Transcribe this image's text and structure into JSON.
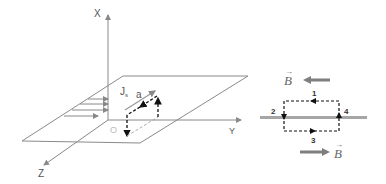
{
  "left_figure": {
    "axes": {
      "x_label": "X",
      "y_label": "Y",
      "z_label": "Z",
      "origin_label": "O"
    },
    "current_label": "J",
    "current_subscript": "s",
    "side_label": "a"
  },
  "right_figure": {
    "field_label_top": "B",
    "field_label_bottom": "B",
    "loop_segments": [
      "1",
      "2",
      "3",
      "4"
    ]
  },
  "colors": {
    "line": "#8a8a8a",
    "dark_line": "#222222",
    "field_arrow": "#7f7f7f",
    "sheet_line": "#9a9a9a"
  }
}
